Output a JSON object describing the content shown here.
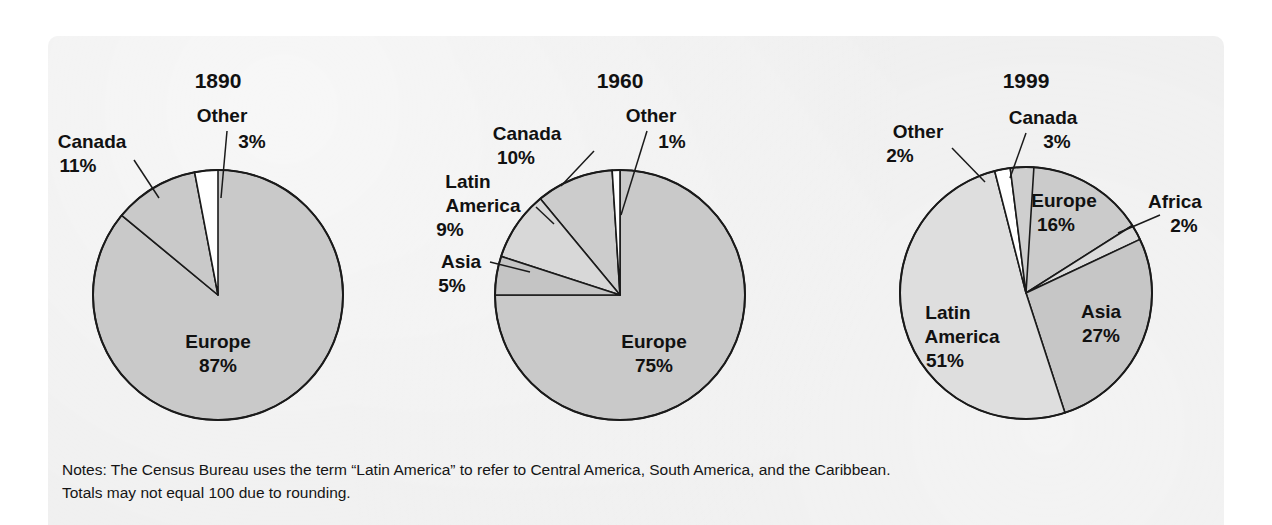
{
  "figure": {
    "background_color": "#eeeeee",
    "page_color": "#ffffff",
    "notes_line_1": "Notes: The Census Bureau uses the term “Latin America” to refer to Central America, South America, and the Caribbean.",
    "notes_line_2": "Totals may not equal 100 due to rounding."
  },
  "chart_data": [
    {
      "type": "pie",
      "title": "1890",
      "categories": [
        "Europe",
        "Canada",
        "Other"
      ],
      "values": [
        87,
        11,
        3
      ],
      "value_labels": [
        "87%",
        "11%",
        "3%"
      ],
      "colors": [
        "#c9c9c9",
        "#c9c9c9",
        "#ffffff"
      ],
      "labels": [
        {
          "name": "Europe",
          "text": "Europe",
          "percent": "87%"
        },
        {
          "name": "Canada",
          "text": "Canada",
          "percent": "11%"
        },
        {
          "name": "Other",
          "text": "Other",
          "percent": "3%"
        }
      ],
      "start_angle_deg": 90,
      "direction": "counterclockwise",
      "grid": false,
      "legend": "none"
    },
    {
      "type": "pie",
      "title": "1960",
      "categories": [
        "Europe",
        "Canada",
        "Latin America",
        "Asia",
        "Other"
      ],
      "values": [
        75,
        10,
        9,
        5,
        1
      ],
      "value_labels": [
        "75%",
        "10%",
        "9%",
        "5%",
        "1%"
      ],
      "colors": [
        "#c9c9c9",
        "#cccccc",
        "#d8d8d8",
        "#c4c4c4",
        "#ffffff"
      ],
      "labels": [
        {
          "name": "Europe",
          "text": "Europe",
          "percent": "75%"
        },
        {
          "name": "Canada",
          "text": "Canada",
          "percent": "10%"
        },
        {
          "name": "Latin America",
          "text_line1": "Latin",
          "text_line2": "America",
          "percent": "9%"
        },
        {
          "name": "Asia",
          "text": "Asia",
          "percent": "5%"
        },
        {
          "name": "Other",
          "text": "Other",
          "percent": "1%"
        }
      ],
      "start_angle_deg": 90,
      "direction": "counterclockwise",
      "grid": false,
      "legend": "none"
    },
    {
      "type": "pie",
      "title": "1999",
      "categories": [
        "Latin America",
        "Asia",
        "Europe",
        "Canada",
        "Other",
        "Africa"
      ],
      "values": [
        51,
        27,
        16,
        3,
        2,
        2
      ],
      "value_labels": [
        "51%",
        "27%",
        "16%",
        "3%",
        "2%",
        "2%"
      ],
      "colors": [
        "#dedede",
        "#c6c6c6",
        "#cbcbcb",
        "#cfcfcf",
        "#ffffff",
        "#d8d8d8"
      ],
      "labels": [
        {
          "name": "Latin America",
          "text_line1": "Latin",
          "text_line2": "America",
          "percent": "51%"
        },
        {
          "name": "Asia",
          "text": "Asia",
          "percent": "27%"
        },
        {
          "name": "Europe",
          "text": "Europe",
          "percent": "16%"
        },
        {
          "name": "Canada",
          "text": "Canada",
          "percent": "3%"
        },
        {
          "name": "Other",
          "text": "Other",
          "percent": "2%"
        },
        {
          "name": "Africa",
          "text": "Africa",
          "percent": "2%"
        }
      ],
      "start_angle_deg": 90,
      "direction": "clockwise",
      "grid": false,
      "legend": "none"
    }
  ]
}
